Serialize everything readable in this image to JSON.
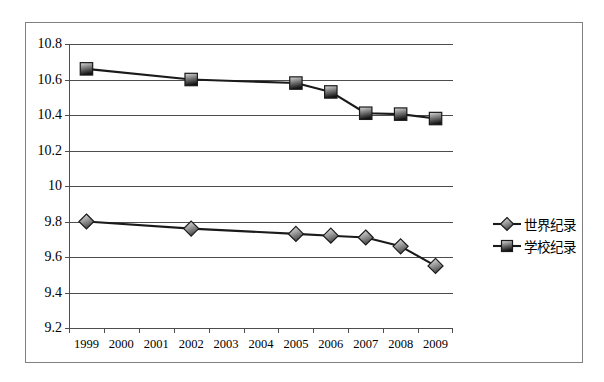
{
  "chart_data": {
    "type": "line",
    "title": "",
    "xlabel": "",
    "ylabel": "",
    "categories": [
      "1999",
      "2000",
      "2001",
      "2002",
      "2003",
      "2004",
      "2005",
      "2006",
      "2007",
      "2008",
      "2009"
    ],
    "ylim": [
      9.2,
      10.8
    ],
    "y_ticks": [
      "9.2",
      "9.4",
      "9.6",
      "9.8",
      "10",
      "10.2",
      "10.4",
      "10.6",
      "10.8"
    ],
    "y_tick_values": [
      9.2,
      9.4,
      9.6,
      9.8,
      10.0,
      10.2,
      10.4,
      10.6,
      10.8
    ],
    "grid": true,
    "legend_position": "right",
    "series": [
      {
        "name": "世界纪录",
        "marker": "diamond",
        "color": "#808080",
        "line_color": "#1a1a1a",
        "points": [
          {
            "x": "1999",
            "y": 9.8
          },
          {
            "x": "2002",
            "y": 9.76
          },
          {
            "x": "2005",
            "y": 9.73
          },
          {
            "x": "2006",
            "y": 9.72
          },
          {
            "x": "2007",
            "y": 9.71
          },
          {
            "x": "2008",
            "y": 9.66
          },
          {
            "x": "2009",
            "y": 9.55
          }
        ]
      },
      {
        "name": "学校纪录",
        "marker": "square",
        "color": "#4d4d4d",
        "line_color": "#1a1a1a",
        "points": [
          {
            "x": "1999",
            "y": 10.66
          },
          {
            "x": "2002",
            "y": 10.6
          },
          {
            "x": "2005",
            "y": 10.58
          },
          {
            "x": "2006",
            "y": 10.53
          },
          {
            "x": "2007",
            "y": 10.41
          },
          {
            "x": "2008",
            "y": 10.405
          },
          {
            "x": "2009",
            "y": 10.38
          }
        ]
      }
    ]
  },
  "legend": {
    "items": [
      {
        "label": "世界纪录",
        "marker": "diamond-marker"
      },
      {
        "label": "学校纪录",
        "marker": "square-marker"
      }
    ]
  }
}
